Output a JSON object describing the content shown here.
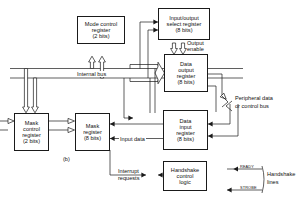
{
  "figure": {
    "caption": "(b)",
    "title_note": "Internal bus"
  },
  "blocks": {
    "mode_control_register": {
      "line1": "Mode control",
      "line2": "register",
      "line3": "(2 bits)"
    },
    "io_select_register": {
      "line1": "Input/output",
      "line2": "select register",
      "line3": "(8 bits)"
    },
    "data_output_register": {
      "line1": "Data",
      "line2": "output",
      "line3": "register",
      "line4": "(8 bits)"
    },
    "mask_control_register": {
      "line1": "Mask",
      "line2": "control",
      "line3": "register",
      "line4": "(2 bits)"
    },
    "mask_register": {
      "line1": "Mask",
      "line2": "register",
      "line3": "(8 bits)"
    },
    "data_input_register": {
      "line1": "Data",
      "line2": "input",
      "line3": "register",
      "line4": "(8 bits)"
    },
    "handshake_control_logic": {
      "line1": "Handshake",
      "line2": "control",
      "line3": "logic"
    }
  },
  "labels": {
    "internal_bus": "Internal bus",
    "output_enable_l1": "Output",
    "output_enable_l2": "enable",
    "peripheral_bus_l1": "Peripheral data",
    "peripheral_bus_l2": "or control bus",
    "input_data": "Input data",
    "interrupt_l1": "Interrupt",
    "interrupt_l2": "requests",
    "ready": "READY",
    "strobe": "STROBE",
    "handshake_lines_l1": "Handshake",
    "handshake_lines_l2": "lines",
    "caption": "(b)"
  },
  "colors": {
    "stroke": "#1a1a1a",
    "background": "#ffffff",
    "text": "#111111"
  }
}
